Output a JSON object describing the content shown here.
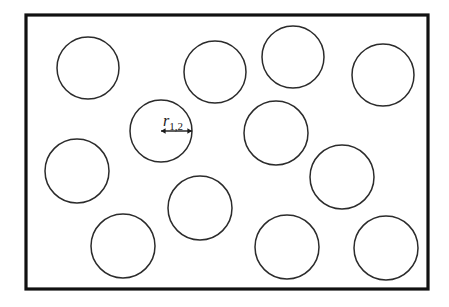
{
  "figure": {
    "type": "schematic-diagram",
    "background_color": "#ffffff",
    "canvas": {
      "width": 449,
      "height": 307
    }
  },
  "frame": {
    "name": "domain-boundary",
    "x": 26,
    "y": 15,
    "width": 402,
    "height": 274,
    "stroke_color": "#111111",
    "stroke_width": 3.2,
    "fill_color": "#ffffff"
  },
  "circles": {
    "stroke_color": "#2b2b2b",
    "stroke_width": 1.5,
    "fill_color": "#ffffff",
    "count": 12,
    "items": [
      {
        "id": "circle-1",
        "cx": 88,
        "cy": 68,
        "r": 31
      },
      {
        "id": "circle-2",
        "cx": 215,
        "cy": 72,
        "r": 31
      },
      {
        "id": "circle-3",
        "cx": 293,
        "cy": 57,
        "r": 31
      },
      {
        "id": "circle-4",
        "cx": 383,
        "cy": 75,
        "r": 31
      },
      {
        "id": "circle-5",
        "cx": 161,
        "cy": 131,
        "r": 31,
        "labelled": true
      },
      {
        "id": "circle-6",
        "cx": 276,
        "cy": 133,
        "r": 32
      },
      {
        "id": "circle-7",
        "cx": 77,
        "cy": 171,
        "r": 32
      },
      {
        "id": "circle-8",
        "cx": 342,
        "cy": 177,
        "r": 32
      },
      {
        "id": "circle-9",
        "cx": 200,
        "cy": 208,
        "r": 32
      },
      {
        "id": "circle-10",
        "cx": 123,
        "cy": 246,
        "r": 32
      },
      {
        "id": "circle-11",
        "cx": 287,
        "cy": 247,
        "r": 32
      },
      {
        "id": "circle-12",
        "cx": 386,
        "cy": 248,
        "r": 32
      }
    ]
  },
  "annotation": {
    "name": "radius-dimension",
    "label_symbol": "r",
    "label_subscript": "1,2",
    "label_full": "r1,2",
    "arrow": {
      "type": "double-headed",
      "x1": 161,
      "x2": 192,
      "y": 131,
      "stroke_color": "#1a1a1a",
      "stroke_width": 1.4,
      "head_size": 4.6
    },
    "label_position": {
      "x": 163,
      "y": 126
    },
    "font_size_symbol": 16,
    "font_size_subscript": 11
  }
}
